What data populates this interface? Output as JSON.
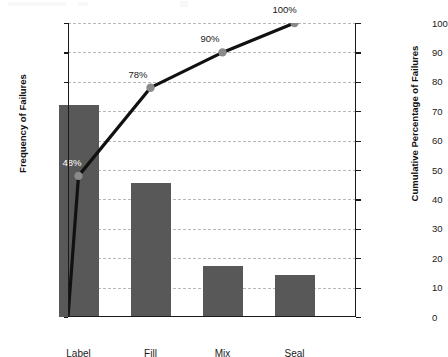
{
  "chart_data": {
    "type": "bar",
    "subtype": "pareto",
    "title": "",
    "categories": [
      "Label",
      "Fill",
      "Mix",
      "Seal"
    ],
    "values": [
      28.8,
      18.2,
      7.0,
      5.7
    ],
    "series": [
      {
        "name": "Frequency of Failures",
        "type": "bar",
        "values": [
          28.8,
          18.2,
          7.0,
          5.7
        ]
      },
      {
        "name": "Cumulative Percentage of Failures",
        "type": "line",
        "values": [
          48,
          78,
          90,
          100
        ]
      }
    ],
    "cumulative_percent": [
      48,
      78,
      90,
      100
    ],
    "cumulative_labels": [
      "48%",
      "78%",
      "90%",
      "100%"
    ],
    "line_origin": {
      "x": 0,
      "y": 0
    },
    "xlabel": "",
    "ylabel": "Frequency of Failures",
    "y2label": "Cumulative Percentage of Failures",
    "ylim": [
      0,
      40
    ],
    "y2lim": [
      0,
      100
    ],
    "yticks": [
      0,
      4,
      8,
      12,
      16,
      20,
      24,
      28,
      32,
      36,
      40
    ],
    "y2ticks": [
      0,
      10,
      20,
      30,
      40,
      50,
      60,
      70,
      80,
      90,
      100
    ],
    "grid": true,
    "grid_axis": "y",
    "grid_style": "dashed",
    "legend": "none",
    "colors": {
      "bar": "#585858",
      "line": "#111111",
      "marker": "#8a8a8a",
      "grid": "#b8b8b8",
      "axis": "#1a1a1a",
      "inbar_label": "#ffffff",
      "background": "#ffffff"
    }
  },
  "axes": {
    "left": {
      "title": "Frequency of Failures",
      "ticks": [
        "0",
        "4",
        "8",
        "12",
        "16",
        "20",
        "24",
        "28",
        "32",
        "36",
        "40"
      ]
    },
    "right": {
      "title": "Cumulative Percentage of Failures",
      "ticks": [
        "0",
        "10",
        "20",
        "30",
        "40",
        "50",
        "60",
        "70",
        "80",
        "90",
        "100"
      ]
    },
    "bottom": {
      "ticks": [
        "Label",
        "Fill",
        "Mix",
        "Seal"
      ]
    }
  },
  "annotations": [
    {
      "text": "48%",
      "category": "Label",
      "placement": "inside-bar"
    },
    {
      "text": "78%",
      "category": "Fill",
      "placement": "above-point"
    },
    {
      "text": "90%",
      "category": "Mix",
      "placement": "above-point"
    },
    {
      "text": "100%",
      "category": "Seal",
      "placement": "above-point"
    }
  ]
}
